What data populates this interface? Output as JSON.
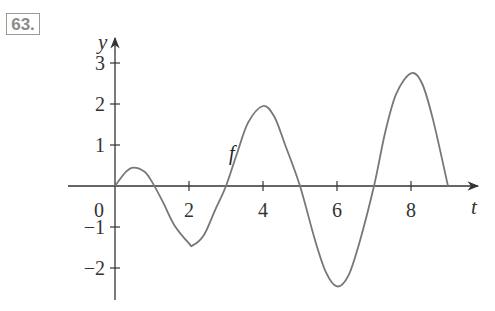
{
  "problem_number": "63.",
  "chart_data": {
    "type": "line",
    "title": "",
    "xlabel": "t",
    "ylabel": "y",
    "curve_label": "f",
    "xlim": [
      0,
      9
    ],
    "ylim": [
      -2.7,
      3.4
    ],
    "x_ticks": [
      2,
      4,
      6,
      8
    ],
    "x_tick_labels": [
      "2",
      "4",
      "6",
      "8"
    ],
    "y_ticks": [
      -2,
      -1,
      1,
      2,
      3
    ],
    "y_tick_labels": [
      "−2",
      "−1",
      "1",
      "2",
      "3"
    ],
    "origin_label": "0",
    "grid": false,
    "legend": null,
    "series": [
      {
        "name": "f",
        "x": [
          0,
          0.3,
          0.5,
          0.8,
          1.0,
          1.3,
          1.6,
          2.0,
          2.1,
          2.4,
          2.7,
          3.0,
          3.3,
          3.6,
          4.0,
          4.3,
          4.6,
          5.0,
          5.4,
          5.7,
          6.0,
          6.3,
          6.6,
          7.0,
          7.3,
          7.6,
          8.0,
          8.3,
          8.6,
          9.0
        ],
        "y": [
          0,
          0.35,
          0.45,
          0.35,
          0.1,
          -0.4,
          -0.95,
          -1.4,
          -1.45,
          -1.2,
          -0.6,
          0,
          0.8,
          1.55,
          1.95,
          1.7,
          1.0,
          0,
          -1.3,
          -2.1,
          -2.45,
          -2.2,
          -1.4,
          0,
          1.3,
          2.25,
          2.75,
          2.5,
          1.6,
          0
        ]
      }
    ]
  }
}
